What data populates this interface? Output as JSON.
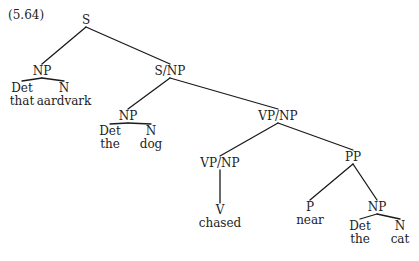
{
  "example_number": "(5.64)",
  "tree": {
    "nodes": [
      {
        "id": "s",
        "label": "S"
      },
      {
        "id": "np1",
        "label": "NP"
      },
      {
        "id": "det1",
        "label": "Det",
        "word": "that"
      },
      {
        "id": "n1",
        "label": "N",
        "word": "aardvark"
      },
      {
        "id": "snp",
        "label": "S/NP"
      },
      {
        "id": "np2",
        "label": "NP"
      },
      {
        "id": "det2",
        "label": "Det",
        "word": "the"
      },
      {
        "id": "n2",
        "label": "N",
        "word": "dog"
      },
      {
        "id": "vpnp1",
        "label": "VP/NP"
      },
      {
        "id": "vpnp2",
        "label": "VP/NP"
      },
      {
        "id": "v",
        "label": "V",
        "word": "chased"
      },
      {
        "id": "pp",
        "label": "PP"
      },
      {
        "id": "p",
        "label": "P",
        "word": "near"
      },
      {
        "id": "np3",
        "label": "NP"
      },
      {
        "id": "det3",
        "label": "Det",
        "word": "the"
      },
      {
        "id": "n3",
        "label": "N",
        "word": "cat"
      }
    ],
    "edges": [
      [
        "s",
        "np1"
      ],
      [
        "s",
        "snp"
      ],
      [
        "np1",
        "det1"
      ],
      [
        "np1",
        "n1"
      ],
      [
        "snp",
        "np2"
      ],
      [
        "snp",
        "vpnp1"
      ],
      [
        "np2",
        "det2"
      ],
      [
        "np2",
        "n2"
      ],
      [
        "vpnp1",
        "vpnp2"
      ],
      [
        "vpnp1",
        "pp"
      ],
      [
        "vpnp2",
        "v"
      ],
      [
        "pp",
        "p"
      ],
      [
        "pp",
        "np3"
      ],
      [
        "np3",
        "det3"
      ],
      [
        "np3",
        "n3"
      ]
    ]
  }
}
